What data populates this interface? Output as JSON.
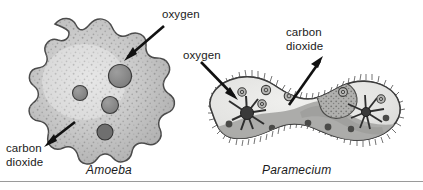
{
  "figure": {
    "background_color": "#ffffff",
    "text_color": "#1a1a1a",
    "rule_color": "#9a9a9a"
  },
  "organisms": [
    {
      "id": "amoeba",
      "caption": "Amoeba",
      "caption_style": "italic",
      "cell_fill": "#c4c4c4",
      "cell_stroke": "#4a4a4a",
      "organelle_fill": "#8a8a8a",
      "organelle_stroke": "#3c3c3c",
      "organelle_count": 4,
      "labels": [
        {
          "name": "oxygen",
          "text": "oxygen",
          "arrow_direction": "inward",
          "arrow_points_to": "cell-interior"
        },
        {
          "name": "carbon-dioxide",
          "text": "carbon\ndioxide",
          "line1": "carbon",
          "line2": "dioxide",
          "arrow_direction": "outward",
          "arrow_points_to": "surrounding-water"
        }
      ]
    },
    {
      "id": "paramecium",
      "caption": "Paramecium",
      "caption_style": "italic",
      "cell_fill": "#e8e8e6",
      "cell_stroke": "#3c3c3c",
      "cilia_color": "#4a4a4a",
      "oral_groove_fill": "#a8a8a6",
      "macronucleus_fill": "#a0a09e",
      "vacuole_fill": "#b4b4b2",
      "contractile_vacuole_count": 2,
      "food_vacuole_count": 12,
      "labels": [
        {
          "name": "oxygen",
          "text": "oxygen",
          "arrow_direction": "inward",
          "arrow_points_to": "cell-interior"
        },
        {
          "name": "carbon-dioxide",
          "text": "carbon\ndioxide",
          "line1": "carbon",
          "line2": "dioxide",
          "arrow_direction": "outward",
          "arrow_points_to": "surrounding-water"
        }
      ]
    }
  ],
  "labels": {
    "amoeba_oxygen": "oxygen",
    "amoeba_co2_line1": "carbon",
    "amoeba_co2_line2": "dioxide",
    "paramecium_oxygen": "oxygen",
    "paramecium_co2_line1": "carbon",
    "paramecium_co2_line2": "dioxide",
    "amoeba_caption": "Amoeba",
    "paramecium_caption": "Paramecium"
  }
}
